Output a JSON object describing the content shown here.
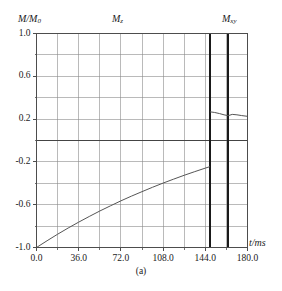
{
  "figure": {
    "caption": "(a)",
    "ylabel_main": "M/M",
    "ylabel_sub": "0",
    "xlabel": "t/ms"
  },
  "series_labels": {
    "mz_main": "M",
    "mz_sub": "z",
    "mxy_main": "M",
    "mxy_sub": "xy"
  },
  "colors": {
    "axis": "#4d4d4d",
    "grid": "#8c8c8c",
    "curve": "#555555",
    "pulse": "#1a1a1a",
    "zero_line": "#444444",
    "background": "#ffffff"
  },
  "chart_data": {
    "type": "line",
    "title": "",
    "subtitle": "",
    "xlabel": "t/ms",
    "ylabel": "M/M0",
    "xlim": [
      0.0,
      180.0
    ],
    "ylim": [
      -1.0,
      1.0
    ],
    "grid": true,
    "legend": "none",
    "xticks": [
      "0.0",
      "36.0",
      "72.0",
      "108.0",
      "144.0",
      "180.0"
    ],
    "xtick_values": [
      0.0,
      36.0,
      72.0,
      108.0,
      144.0,
      180.0
    ],
    "xminor_step": 18.0,
    "yticks": [
      "1.0",
      "0.6",
      "0.2",
      "-0.2",
      "-0.6",
      "-1.0"
    ],
    "ytick_values": [
      1.0,
      0.6,
      0.2,
      -0.2,
      -0.6,
      -1.0
    ],
    "yminor_step": 0.2,
    "annotations": [
      {
        "label": "M_z",
        "x": 72.0,
        "y": 1.12
      },
      {
        "label": "M_xy",
        "x": 165.0,
        "y": 1.12
      }
    ],
    "vertical_markers": [
      {
        "label": "rf-pulse-1",
        "x": 148.0
      },
      {
        "label": "rf-pulse-2",
        "x": 163.5
      }
    ],
    "horizontal_markers": [
      {
        "label": "zero-line",
        "y": 0.0
      }
    ],
    "series": [
      {
        "name": "M_z",
        "x": [
          0.0,
          9.0,
          18.0,
          27.0,
          36.0,
          45.0,
          54.0,
          63.0,
          72.0,
          81.0,
          90.0,
          99.0,
          108.0,
          117.0,
          126.0,
          135.0,
          144.0,
          148.0
        ],
        "values": [
          -1.0,
          -0.937,
          -0.876,
          -0.818,
          -0.763,
          -0.71,
          -0.659,
          -0.611,
          -0.564,
          -0.52,
          -0.478,
          -0.437,
          -0.398,
          -0.361,
          -0.325,
          -0.291,
          -0.258,
          -0.244
        ]
      },
      {
        "name": "M_xy",
        "x": [
          148.0,
          152.0,
          156.0,
          160.0,
          163.5,
          167.0,
          171.0,
          175.0,
          180.0
        ],
        "values": [
          0.268,
          0.262,
          0.252,
          0.24,
          0.232,
          0.244,
          0.24,
          0.233,
          0.226
        ]
      }
    ]
  }
}
